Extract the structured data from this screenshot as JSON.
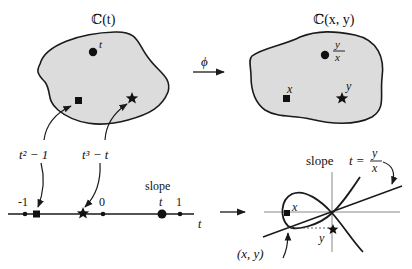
{
  "left_field": {
    "title": "ℂ(t)",
    "point_circle_label": "t",
    "point_square_label": "",
    "point_star_label": ""
  },
  "right_field": {
    "title": "ℂ(x, y)",
    "point_circle_label_num": "y",
    "point_circle_label_den": "x",
    "point_square_label": "x",
    "point_star_label": "y"
  },
  "map_arrow": {
    "label": "ϕ"
  },
  "preimage_labels": {
    "square": "t² − 1",
    "star": "t³ − t"
  },
  "number_line": {
    "axis_label": "t",
    "tick_minus_one": "-1",
    "tick_zero": "0",
    "tick_one": "1",
    "slope_label": "slope",
    "slope_point_label": "t"
  },
  "curve_plot": {
    "slope_text": "slope",
    "slope_var": "t =",
    "slope_frac_num": "y",
    "slope_frac_den": "x",
    "point_x_label": "x",
    "point_y_label": "y",
    "point_xy_label": "(x, y)"
  },
  "colors": {
    "field_fill": "#dcdcdc",
    "stroke": "#1a1a1a"
  }
}
